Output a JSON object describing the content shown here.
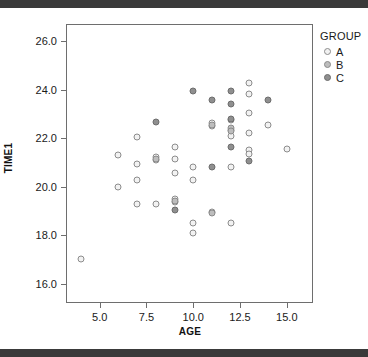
{
  "chart_data": {
    "type": "scatter",
    "title": "",
    "xlabel": "AGE",
    "ylabel": "TIME1",
    "xlim": [
      3.2,
      16.4
    ],
    "ylim": [
      15.2,
      26.7
    ],
    "xticks": [
      "5.0",
      "7.5",
      "10.0",
      "12.5",
      "15.0"
    ],
    "xtick_values": [
      5.0,
      7.5,
      10.0,
      12.5,
      15.0
    ],
    "yticks": [
      "26.0",
      "24.0",
      "22.0",
      "20.0",
      "18.0",
      "16.0"
    ],
    "ytick_values": [
      26.0,
      24.0,
      22.0,
      20.0,
      18.0,
      16.0
    ],
    "grid": false,
    "legend": {
      "title": "GROUP",
      "position": "right-top",
      "entries": [
        {
          "name": "A",
          "color": "#f2f2f2"
        },
        {
          "name": "B",
          "color": "#bdbdbd"
        },
        {
          "name": "C",
          "color": "#8f8f8f"
        }
      ]
    },
    "series": [
      {
        "name": "A",
        "color": "#f2f2f2",
        "points": [
          {
            "x": 4.0,
            "y": 17.0
          },
          {
            "x": 6.0,
            "y": 21.3
          },
          {
            "x": 6.0,
            "y": 20.0
          },
          {
            "x": 7.0,
            "y": 22.05
          },
          {
            "x": 7.0,
            "y": 20.95
          },
          {
            "x": 7.0,
            "y": 20.25
          },
          {
            "x": 7.0,
            "y": 19.3
          },
          {
            "x": 8.0,
            "y": 21.2
          },
          {
            "x": 8.0,
            "y": 21.1
          },
          {
            "x": 8.0,
            "y": 19.3
          },
          {
            "x": 9.0,
            "y": 21.65
          },
          {
            "x": 9.0,
            "y": 21.15
          },
          {
            "x": 9.0,
            "y": 20.55
          },
          {
            "x": 9.0,
            "y": 19.5
          },
          {
            "x": 9.0,
            "y": 19.35
          },
          {
            "x": 10.0,
            "y": 20.8
          },
          {
            "x": 10.0,
            "y": 20.25
          },
          {
            "x": 10.0,
            "y": 18.5
          },
          {
            "x": 10.0,
            "y": 18.1
          },
          {
            "x": 11.0,
            "y": 22.6
          },
          {
            "x": 11.0,
            "y": 22.5
          },
          {
            "x": 11.0,
            "y": 18.95
          },
          {
            "x": 12.0,
            "y": 22.75
          },
          {
            "x": 12.0,
            "y": 22.35
          },
          {
            "x": 12.0,
            "y": 22.1
          },
          {
            "x": 12.0,
            "y": 20.8
          },
          {
            "x": 12.0,
            "y": 18.5
          },
          {
            "x": 13.0,
            "y": 24.25
          },
          {
            "x": 13.0,
            "y": 23.8
          },
          {
            "x": 13.0,
            "y": 23.05
          },
          {
            "x": 13.0,
            "y": 22.2
          },
          {
            "x": 13.0,
            "y": 21.5
          },
          {
            "x": 13.0,
            "y": 21.35
          },
          {
            "x": 14.0,
            "y": 22.55
          },
          {
            "x": 15.0,
            "y": 21.55
          }
        ]
      },
      {
        "name": "B",
        "color": "#bdbdbd",
        "points": [
          {
            "x": 8.0,
            "y": 21.15
          },
          {
            "x": 9.0,
            "y": 19.4
          },
          {
            "x": 11.0,
            "y": 22.55
          },
          {
            "x": 11.0,
            "y": 18.9
          },
          {
            "x": 12.0,
            "y": 22.4
          },
          {
            "x": 12.0,
            "y": 22.3
          }
        ]
      },
      {
        "name": "C",
        "color": "#8f8f8f",
        "points": [
          {
            "x": 8.0,
            "y": 22.65
          },
          {
            "x": 9.0,
            "y": 19.05
          },
          {
            "x": 10.0,
            "y": 23.95
          },
          {
            "x": 11.0,
            "y": 23.55
          },
          {
            "x": 11.0,
            "y": 20.8
          },
          {
            "x": 12.0,
            "y": 23.95
          },
          {
            "x": 12.0,
            "y": 23.4
          },
          {
            "x": 12.0,
            "y": 22.8
          },
          {
            "x": 12.0,
            "y": 21.65
          },
          {
            "x": 13.0,
            "y": 21.05
          },
          {
            "x": 14.0,
            "y": 23.55
          }
        ]
      }
    ]
  }
}
